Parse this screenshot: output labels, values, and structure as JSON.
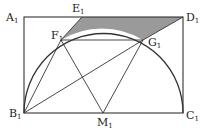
{
  "diagram": {
    "title": "",
    "colors": {
      "stroke": "#333333",
      "shade": "#9a9a9a",
      "background": "#ffffff"
    },
    "points": {
      "A1": {
        "label": "A",
        "sub": "1",
        "x": 24,
        "y": 17
      },
      "D1": {
        "label": "D",
        "sub": "1",
        "x": 183,
        "y": 17
      },
      "B1": {
        "label": "B",
        "sub": "1",
        "x": 24,
        "y": 113
      },
      "C1": {
        "label": "C",
        "sub": "1",
        "x": 183,
        "y": 113
      },
      "M1": {
        "label": "M",
        "sub": "1",
        "x": 103,
        "y": 113
      },
      "E1": {
        "label": "E",
        "sub": "1",
        "x": 82,
        "y": 17
      },
      "F1": {
        "label": "F",
        "sub": "1",
        "x": 61,
        "y": 40
      },
      "G1": {
        "label": "G",
        "sub": "1",
        "x": 143,
        "y": 40
      }
    },
    "segments": [
      [
        "A1",
        "D1"
      ],
      [
        "D1",
        "C1"
      ],
      [
        "C1",
        "B1"
      ],
      [
        "B1",
        "A1"
      ],
      [
        "F1",
        "G1"
      ],
      [
        "B1",
        "F1"
      ],
      [
        "B1",
        "G1"
      ],
      [
        "F1",
        "M1"
      ],
      [
        "G1",
        "M1"
      ],
      [
        "E1",
        "F1"
      ],
      [
        "D1",
        "G1"
      ]
    ],
    "arc": {
      "center": "M1",
      "from": "B1",
      "to": "C1",
      "type": "semicircle"
    },
    "shaded_region": [
      "E1",
      "D1",
      "G1",
      "arc",
      "F1"
    ]
  }
}
